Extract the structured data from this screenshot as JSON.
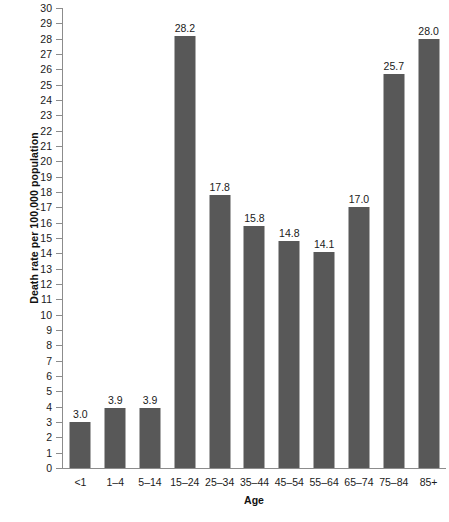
{
  "chart_data": {
    "type": "bar",
    "title": "",
    "xlabel": "Age",
    "ylabel": "Death rate per 100,000 population",
    "categories": [
      "<1",
      "1–4",
      "5–14",
      "15–24",
      "25–34",
      "35–44",
      "45–54",
      "55–64",
      "65–74",
      "75–84",
      "85+"
    ],
    "values": [
      3.0,
      3.9,
      3.9,
      28.2,
      17.8,
      15.8,
      14.8,
      14.1,
      17.0,
      25.7,
      28.0
    ],
    "value_labels": [
      "3.0",
      "3.9",
      "3.9",
      "28.2",
      "17.8",
      "15.8",
      "14.8",
      "14.1",
      "17.0",
      "25.7",
      "28.0"
    ],
    "ylim": [
      0,
      30
    ],
    "ytick_step": 1,
    "yticks": [
      "0",
      "1",
      "2",
      "3",
      "4",
      "5",
      "6",
      "7",
      "8",
      "9",
      "10",
      "11",
      "12",
      "13",
      "14",
      "15",
      "16",
      "17",
      "18",
      "19",
      "20",
      "21",
      "22",
      "23",
      "24",
      "25",
      "26",
      "27",
      "28",
      "29",
      "30"
    ],
    "grid": false,
    "legend": null,
    "bar_color": "#585858",
    "axis_color": "#8c8c8c"
  },
  "caption": {
    "text": ""
  }
}
